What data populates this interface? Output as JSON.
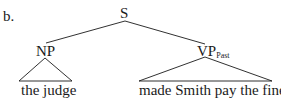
{
  "example_label": "b.",
  "tree": {
    "root": {
      "label": "S"
    },
    "children": [
      {
        "label": "NP",
        "subscript": "",
        "yield": "the judge"
      },
      {
        "label": "VP",
        "subscript": "Past",
        "yield": "made Smith pay the fines"
      }
    ]
  },
  "colors": {
    "ink": "#1a1a1a",
    "background": "#ffffff"
  }
}
